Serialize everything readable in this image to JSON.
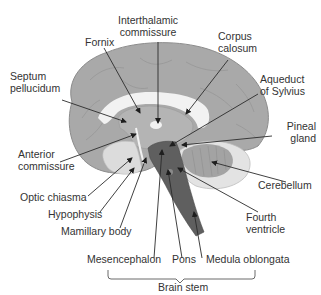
{
  "diagram": {
    "colors": {
      "cortex": "#a9a9a9",
      "cortex_edge": "#8c8c8c",
      "white_matter": "#f2f2f2",
      "inner_gray": "#bdbdbd",
      "brainstem": "#5f5f5f",
      "cerebellum_outer": "#e3e3e3",
      "cerebellum_inner": "#a3a3a3",
      "label_text": "#333333",
      "arrow": "#2b2b2b"
    },
    "labels": {
      "interthalamic_1": "Interthalamic",
      "interthalamic_2": "commissure",
      "fornix": "Fornix",
      "corpus_1": "Corpus",
      "corpus_2": "calosum",
      "septum_1": "Septum",
      "septum_2": "pellucidum",
      "aqueduct_1": "Aqueduct",
      "aqueduct_2": "of Sylvius",
      "pineal_1": "Pineal",
      "pineal_2": "gland",
      "anterior_1": "Anterior",
      "anterior_2": "commissure",
      "cerebellum": "Cerebellum",
      "optic": "Optic chiasma",
      "hypophysis": "Hypophysis",
      "fourth_1": "Fourth",
      "fourth_2": "ventricle",
      "mamillary": "Mamillary body",
      "mesencephalon": "Mesencephalon",
      "pons": "Pons",
      "medula": "Medula oblongata",
      "brainstem": "Brain stem"
    }
  }
}
